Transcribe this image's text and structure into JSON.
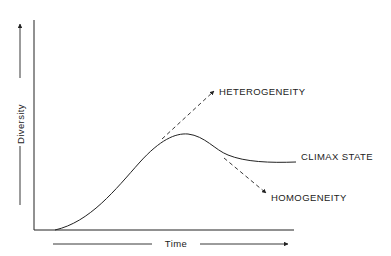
{
  "diagram": {
    "axes": {
      "y_label": "Diversity",
      "x_label": "Time"
    },
    "labels": {
      "heterogeneity": "HETEROGENEITY",
      "climax": "CLIMAX STATE",
      "homogeneity": "HOMOGENEITY"
    },
    "colors": {
      "line": "#222222",
      "background": "#ffffff"
    }
  }
}
